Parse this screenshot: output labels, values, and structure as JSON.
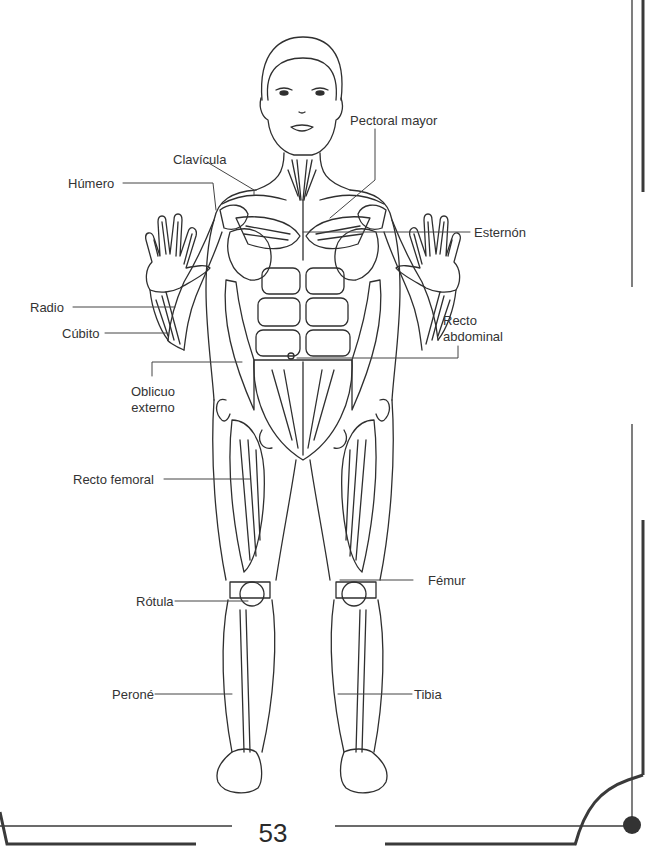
{
  "page": {
    "number": "53"
  },
  "figure": {
    "labels": [
      {
        "id": "clavicula",
        "text": "Clavícula",
        "side": "left"
      },
      {
        "id": "pectoral-mayor",
        "text": "Pectoral mayor",
        "side": "right"
      },
      {
        "id": "humero",
        "text": "Húmero",
        "side": "left"
      },
      {
        "id": "esternon",
        "text": "Esternón",
        "side": "right"
      },
      {
        "id": "radio",
        "text": "Radio",
        "side": "left"
      },
      {
        "id": "cubito",
        "text": "Cúbito",
        "side": "left"
      },
      {
        "id": "recto-abdominal",
        "text": "Recto abdominal",
        "lines": [
          "Recto",
          "abdominal"
        ],
        "side": "right"
      },
      {
        "id": "oblicuo-externo",
        "text": "Oblicuo externo",
        "lines": [
          "Oblicuo",
          "externo"
        ],
        "side": "left"
      },
      {
        "id": "recto-femoral",
        "text": "Recto femoral",
        "side": "left"
      },
      {
        "id": "femur",
        "text": "Fémur",
        "side": "right"
      },
      {
        "id": "rotula",
        "text": "Rótula",
        "side": "left"
      },
      {
        "id": "perone",
        "text": "Peroné",
        "side": "left"
      },
      {
        "id": "tibia",
        "text": "Tibia",
        "side": "right"
      }
    ]
  },
  "colors": {
    "ink": "#333333",
    "frame": "#3a3a3a",
    "background": "#ffffff"
  }
}
